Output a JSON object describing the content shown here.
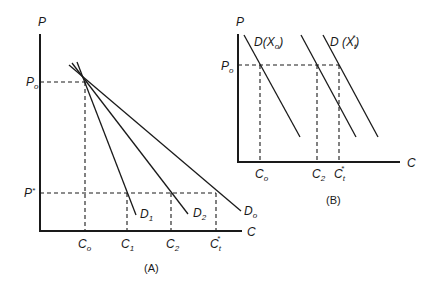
{
  "panel_a": {
    "caption": "(A)",
    "y_axis_label": "P",
    "x_axis_label": "C",
    "price_levels": [
      {
        "main": "P",
        "sub": "o",
        "sup": ""
      },
      {
        "main": "P",
        "sub": "",
        "sup": "*"
      }
    ],
    "x_ticks": [
      {
        "main": "C",
        "sub": "o",
        "sup": ""
      },
      {
        "main": "C",
        "sub": "1",
        "sup": ""
      },
      {
        "main": "C",
        "sub": "2",
        "sup": ""
      },
      {
        "main": "C",
        "sub": "t",
        "sup": "*"
      }
    ],
    "curves": [
      {
        "main": "D",
        "sub": "1"
      },
      {
        "main": "D",
        "sub": "2"
      },
      {
        "main": "D",
        "sub": "o"
      }
    ]
  },
  "panel_b": {
    "caption": "(B)",
    "y_axis_label": "P",
    "x_axis_label": "C",
    "price_levels": [
      {
        "main": "P",
        "sub": "o",
        "sup": ""
      }
    ],
    "x_ticks": [
      {
        "main": "C",
        "sub": "o",
        "sup": ""
      },
      {
        "main": "C",
        "sub": "2",
        "sup": ""
      },
      {
        "main": "C",
        "sub": "t",
        "sup": "*"
      }
    ],
    "curves": [
      {
        "label": "D(X",
        "sub": "o",
        "close": ")",
        "sup": ""
      },
      {
        "label": "",
        "sub": "",
        "close": "",
        "sup": ""
      },
      {
        "label": "D (X",
        "sub": "t",
        "close": ")",
        "sup": "*"
      }
    ]
  }
}
